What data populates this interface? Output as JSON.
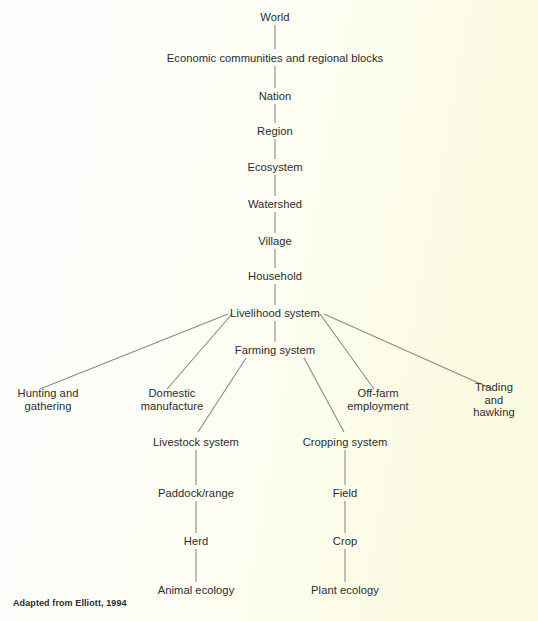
{
  "diagram": {
    "caption": "Adapted from Elliott, 1994",
    "colors": {
      "background_left": "#fefefc",
      "background_right": "#fafae0",
      "text": "#2c2c2c",
      "edge": "#8a8a86"
    },
    "spine": [
      {
        "id": "world",
        "label": "World",
        "x": 275,
        "y": 17
      },
      {
        "id": "economic-communities",
        "label": "Economic communities and regional blocks",
        "x": 275,
        "y": 58
      },
      {
        "id": "nation",
        "label": "Nation",
        "x": 275,
        "y": 96
      },
      {
        "id": "region",
        "label": "Region",
        "x": 275,
        "y": 131
      },
      {
        "id": "ecosystem",
        "label": "Ecosystem",
        "x": 275,
        "y": 167
      },
      {
        "id": "watershed",
        "label": "Watershed",
        "x": 275,
        "y": 204
      },
      {
        "id": "village",
        "label": "Village",
        "x": 275,
        "y": 241
      },
      {
        "id": "household",
        "label": "Household",
        "x": 275,
        "y": 276
      },
      {
        "id": "livelihood-system",
        "label": "Livelihood system",
        "x": 275,
        "y": 313
      },
      {
        "id": "farming-system",
        "label": "Farming system",
        "x": 275,
        "y": 350
      }
    ],
    "livelihood_branches": [
      {
        "id": "hunting-and-gathering",
        "label": "Hunting and\ngathering",
        "x": 48,
        "y": 400
      },
      {
        "id": "domestic-manufacture",
        "label": "Domestic\nmanufacture",
        "x": 172,
        "y": 400
      },
      {
        "id": "off-farm-employment",
        "label": "Off-farm\nemployment",
        "x": 378,
        "y": 400
      },
      {
        "id": "trading-and-hawking",
        "label": "Trading and\nhawking",
        "x": 494,
        "y": 400
      }
    ],
    "farming_branches": [
      {
        "id": "livestock-system",
        "label": "Livestock system",
        "x": 196,
        "y": 442
      },
      {
        "id": "cropping-system",
        "label": "Cropping system",
        "x": 345,
        "y": 442
      }
    ],
    "livestock_chain": [
      {
        "id": "paddock-range",
        "label": "Paddock/range",
        "x": 196,
        "y": 493
      },
      {
        "id": "herd",
        "label": "Herd",
        "x": 196,
        "y": 541
      },
      {
        "id": "animal-ecology",
        "label": "Animal ecology",
        "x": 196,
        "y": 590
      }
    ],
    "cropping_chain": [
      {
        "id": "field",
        "label": "Field",
        "x": 345,
        "y": 493
      },
      {
        "id": "crop",
        "label": "Crop",
        "x": 345,
        "y": 541
      },
      {
        "id": "plant-ecology",
        "label": "Plant ecology",
        "x": 345,
        "y": 590
      }
    ]
  }
}
